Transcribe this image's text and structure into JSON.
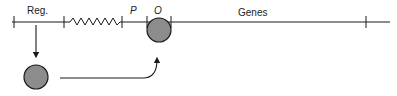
{
  "diagram": {
    "labels": {
      "regulator": "Reg.",
      "promoter": "P",
      "operator": "O",
      "genes": "Genes"
    },
    "colors": {
      "line": "#1a1a1a",
      "circle_fill": "#8c8c8c",
      "circle_stroke": "#1a1a1a",
      "background": "#ffffff"
    }
  }
}
